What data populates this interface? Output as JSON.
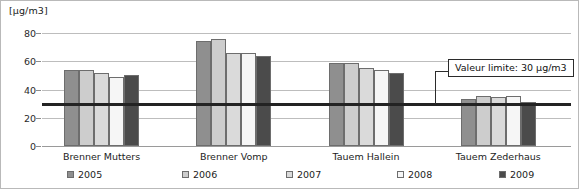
{
  "chart_data": {
    "type": "bar",
    "title": "",
    "xlabel": "",
    "ylabel": "[µg/m3]",
    "ylim": [
      0,
      80
    ],
    "yticks": [
      0,
      20,
      40,
      60,
      80
    ],
    "ytick_labels": [
      "0",
      "20",
      "40",
      "60",
      "80"
    ],
    "grid": true,
    "legend_position": "bottom",
    "categories": [
      "Brenner Mutters",
      "Brenner Vomp",
      "Tauem Hallein",
      "Tauem Zederhaus"
    ],
    "series": [
      {
        "name": "2005",
        "color": "#8f8f8f",
        "values": [
          54,
          74,
          58.5,
          33.5
        ]
      },
      {
        "name": "2006",
        "color": "#cdcdcd",
        "values": [
          54,
          76,
          58.5,
          35.5
        ]
      },
      {
        "name": "2007",
        "color": "#dadada",
        "values": [
          51.5,
          66,
          55,
          35
        ]
      },
      {
        "name": "2008",
        "color": "#f6f6f6",
        "values": [
          49,
          66,
          54,
          35.5
        ]
      },
      {
        "name": "2009",
        "color": "#4b4b4b",
        "values": [
          50,
          63.5,
          52,
          31.5
        ]
      }
    ],
    "annotations": [
      {
        "label": "Valeur limite: 30 µg/m3",
        "value": 30,
        "type": "hline",
        "color": "#232323"
      }
    ]
  },
  "unit_label": "[µg/m3]",
  "limit_callout": "Valeur limite: 30 µg/m3"
}
